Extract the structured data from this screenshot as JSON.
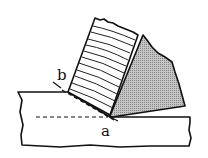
{
  "diagram": {
    "labels": {
      "b": "b",
      "a": "a"
    },
    "parts": {
      "workpiece": {
        "fill": "#ffffff",
        "stroke": "#111111"
      },
      "chip": {
        "fill": "#ffffff",
        "stroke": "#111111",
        "hatch": "curved parallel lines"
      },
      "tool": {
        "fill": "#b8b8b8",
        "stroke": "#111111"
      },
      "depth_line": {
        "style": "dashed"
      },
      "shear_plane": {
        "style": "dashed"
      }
    }
  }
}
